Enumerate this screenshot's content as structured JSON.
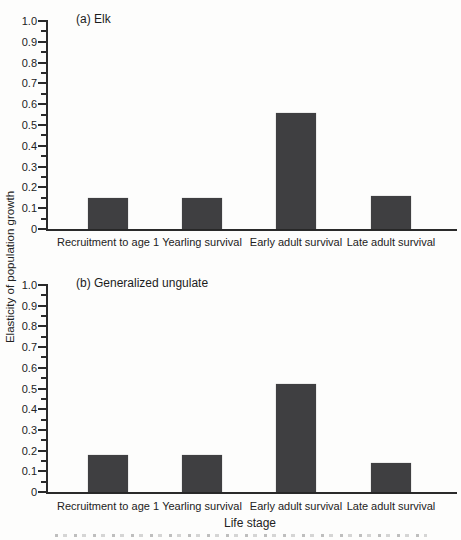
{
  "figure": {
    "y_axis_title": "Elasticity of population growth",
    "x_axis_title": "Life stage"
  },
  "chart_data": {
    "type": "bar",
    "ylabel": "Elasticity of population growth",
    "xlabel": "Life stage",
    "categories": [
      "Recruitment to age 1",
      "Yearling survival",
      "Early adult survival",
      "Late adult survival"
    ],
    "ylim": [
      0,
      1.0
    ],
    "ytick_step": 0.1,
    "minor_tick_step": 0.05,
    "grid": false,
    "legend": false,
    "bar_color": "#3f3f41",
    "panels": [
      {
        "label": "(a) Elk",
        "values": [
          0.15,
          0.15,
          0.56,
          0.16
        ]
      },
      {
        "label": "(b) Generalized ungulate",
        "values": [
          0.18,
          0.18,
          0.52,
          0.14
        ]
      }
    ]
  }
}
